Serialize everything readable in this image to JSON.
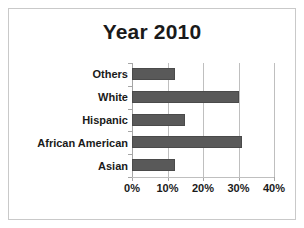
{
  "chart_data": {
    "type": "bar",
    "orientation": "horizontal",
    "title": "Year 2010",
    "xlabel": "",
    "ylabel": "",
    "categories": [
      "Asian",
      "African American",
      "Hispanic",
      "White",
      "Others"
    ],
    "values": [
      12,
      31,
      15,
      30,
      12
    ],
    "value_unit": "%",
    "xlim": [
      0,
      40
    ],
    "xticks": [
      0,
      10,
      20,
      30,
      40
    ],
    "xtick_labels": [
      "0%",
      "10%",
      "20%",
      "30%",
      "40%"
    ],
    "grid": "vertical",
    "legend": "none",
    "series": [
      {
        "name": "Year 2010",
        "values": [
          12,
          31,
          15,
          30,
          12
        ],
        "color": "#595959"
      }
    ],
    "category_order_top_to_bottom": [
      "Others",
      "White",
      "Hispanic",
      "African American",
      "Asian"
    ]
  },
  "colors": {
    "bar_fill": "#595959",
    "bar_outline": "#4a4a4a",
    "gridline": "#bfbfbf",
    "axis": "#a6a6a6",
    "frame_border": "#c9c9c9",
    "text": "#1a1a1a",
    "background": "#ffffff"
  },
  "labels": {
    "cat_0": "Others",
    "cat_1": "White",
    "cat_2": "Hispanic",
    "cat_3": "African American",
    "cat_4": "Asian",
    "x_0": "0%",
    "x_1": "10%",
    "x_2": "20%",
    "x_3": "30%",
    "x_4": "40%"
  }
}
